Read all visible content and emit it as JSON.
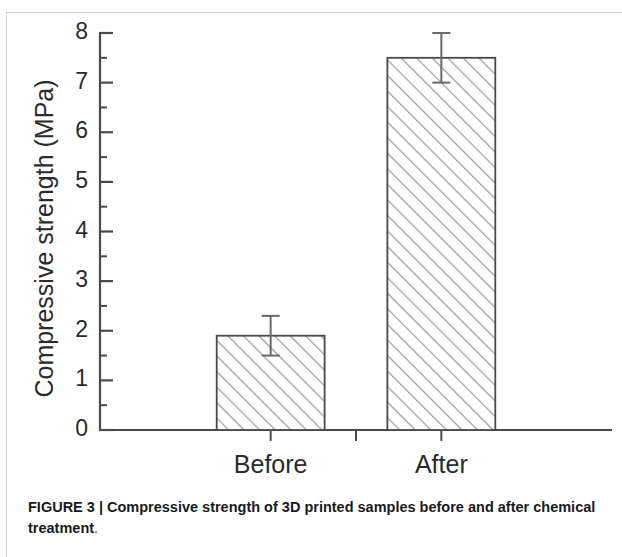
{
  "figure": {
    "caption_bold": "FIGURE 3 | Compressive strength of 3D printed samples before and after chemical treatment",
    "caption_tail": "."
  },
  "chart_data": {
    "type": "bar",
    "title": "",
    "xlabel": "",
    "ylabel": "Compressive strength (MPa)",
    "categories": [
      "Before",
      "After"
    ],
    "values": [
      1.9,
      7.5
    ],
    "errors": [
      0.4,
      0.5
    ],
    "ylim": [
      0,
      8
    ],
    "y_ticks": [
      0,
      1,
      2,
      3,
      4,
      5,
      6,
      7,
      8
    ],
    "y_tick_labels": [
      "0",
      "1",
      "2",
      "3",
      "4",
      "5",
      "6",
      "7",
      "8"
    ],
    "y_minor_tick_step": 0.5,
    "grid": false,
    "legend": false,
    "bar_fill": "#ffffff",
    "bar_edge_color": "#4a4a4a",
    "bar_hatch": "diagonal-45",
    "hatch_color": "#9a9a9a",
    "axis_color": "#4a4a4a",
    "error_bar_color": "#6a6a6a",
    "bar_width_ratio": 0.62
  }
}
